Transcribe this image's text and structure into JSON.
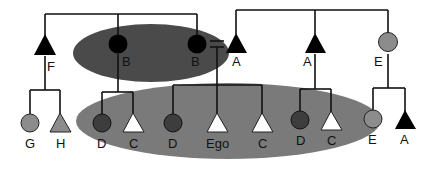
{
  "diagram": {
    "type": "kinship-chart",
    "colors": {
      "male_dark": "#000000",
      "female_dark": "#000000",
      "ellipse_upper": "#4a4a4a",
      "ellipse_lower": "#7a7a7a",
      "grey_node": "#8c8c8c",
      "dark_grey_node": "#3d3d3d",
      "white_node": "#ffffff",
      "line": "#111111"
    },
    "generation1": [
      {
        "id": "F",
        "label": "F",
        "shape": "triangle",
        "fill": "black"
      },
      {
        "id": "B1",
        "label": "B",
        "shape": "circle",
        "fill": "black"
      },
      {
        "id": "B2",
        "label": "B",
        "shape": "circle",
        "fill": "black"
      },
      {
        "id": "A1",
        "label": "A",
        "shape": "triangle",
        "fill": "black"
      },
      {
        "id": "A2",
        "label": "A",
        "shape": "triangle",
        "fill": "black"
      },
      {
        "id": "E1",
        "label": "E",
        "shape": "circle",
        "fill": "grey"
      }
    ],
    "generation2": [
      {
        "id": "G",
        "label": "G",
        "shape": "circle",
        "fill": "grey"
      },
      {
        "id": "H",
        "label": "H",
        "shape": "triangle",
        "fill": "grey"
      },
      {
        "id": "D1",
        "label": "D",
        "shape": "circle",
        "fill": "dark-grey"
      },
      {
        "id": "C1",
        "label": "C",
        "shape": "triangle",
        "fill": "white"
      },
      {
        "id": "D2",
        "label": "D",
        "shape": "circle",
        "fill": "dark-grey"
      },
      {
        "id": "Ego",
        "label": "Ego",
        "shape": "triangle",
        "fill": "white"
      },
      {
        "id": "C2",
        "label": "C",
        "shape": "triangle",
        "fill": "white"
      },
      {
        "id": "D3",
        "label": "D",
        "shape": "circle",
        "fill": "dark-grey"
      },
      {
        "id": "C3",
        "label": "C",
        "shape": "triangle",
        "fill": "white"
      },
      {
        "id": "E2",
        "label": "E",
        "shape": "circle",
        "fill": "grey"
      },
      {
        "id": "A3",
        "label": "A",
        "shape": "triangle",
        "fill": "black"
      }
    ],
    "marriage_symbol": "="
  }
}
